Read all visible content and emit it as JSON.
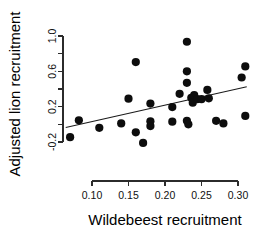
{
  "chart_data": {
    "type": "scatter",
    "title": "",
    "xlabel": "Wildebeest recruitment",
    "ylabel": "Adjusted lion recruitment",
    "xlim": [
      0.06,
      0.32
    ],
    "ylim": [
      -0.28,
      1.05
    ],
    "xticks": [
      0.1,
      0.15,
      0.2,
      0.25,
      0.3
    ],
    "xtick_labels": [
      "0.10",
      "0.15",
      "0.20",
      "0.25",
      "0.30"
    ],
    "yticks": [
      -0.2,
      0.0,
      0.2,
      0.4,
      0.6,
      0.8,
      1.0
    ],
    "ytick_labels": [
      "-0.2",
      "",
      "0.2",
      "",
      "0.6",
      "",
      "1.0"
    ],
    "ytick_labels_shown": [
      "1.0",
      "0.6",
      "0.2",
      "-0.2"
    ],
    "grid": false,
    "legend": false,
    "points": [
      {
        "x": 0.07,
        "y": -0.145
      },
      {
        "x": 0.082,
        "y": 0.045
      },
      {
        "x": 0.11,
        "y": -0.04
      },
      {
        "x": 0.14,
        "y": 0.01
      },
      {
        "x": 0.15,
        "y": 0.29
      },
      {
        "x": 0.16,
        "y": 0.705
      },
      {
        "x": 0.16,
        "y": -0.09
      },
      {
        "x": 0.17,
        "y": -0.21
      },
      {
        "x": 0.18,
        "y": 0.235
      },
      {
        "x": 0.18,
        "y": 0.035
      },
      {
        "x": 0.18,
        "y": -0.02
      },
      {
        "x": 0.21,
        "y": 0.195
      },
      {
        "x": 0.21,
        "y": 0.03
      },
      {
        "x": 0.22,
        "y": 0.345
      },
      {
        "x": 0.23,
        "y": 0.935
      },
      {
        "x": 0.23,
        "y": 0.6
      },
      {
        "x": 0.23,
        "y": 0.47
      },
      {
        "x": 0.23,
        "y": 0.04
      },
      {
        "x": 0.232,
        "y": 0.0
      },
      {
        "x": 0.236,
        "y": 0.3
      },
      {
        "x": 0.238,
        "y": 0.245
      },
      {
        "x": 0.24,
        "y": 0.33
      },
      {
        "x": 0.244,
        "y": 0.285
      },
      {
        "x": 0.25,
        "y": 0.285
      },
      {
        "x": 0.258,
        "y": 0.39
      },
      {
        "x": 0.26,
        "y": 0.295
      },
      {
        "x": 0.27,
        "y": 0.04
      },
      {
        "x": 0.28,
        "y": 0.01
      },
      {
        "x": 0.305,
        "y": 0.53
      },
      {
        "x": 0.31,
        "y": 0.655
      },
      {
        "x": 0.31,
        "y": 0.095
      }
    ],
    "fit_line": {
      "x1": 0.064,
      "y1": -0.035,
      "x2": 0.312,
      "y2": 0.425
    },
    "point_color": "#0d0d0d",
    "line_color": "#1a1a1a",
    "axis_color": "#2b2b2b",
    "background": "#ffffff"
  }
}
